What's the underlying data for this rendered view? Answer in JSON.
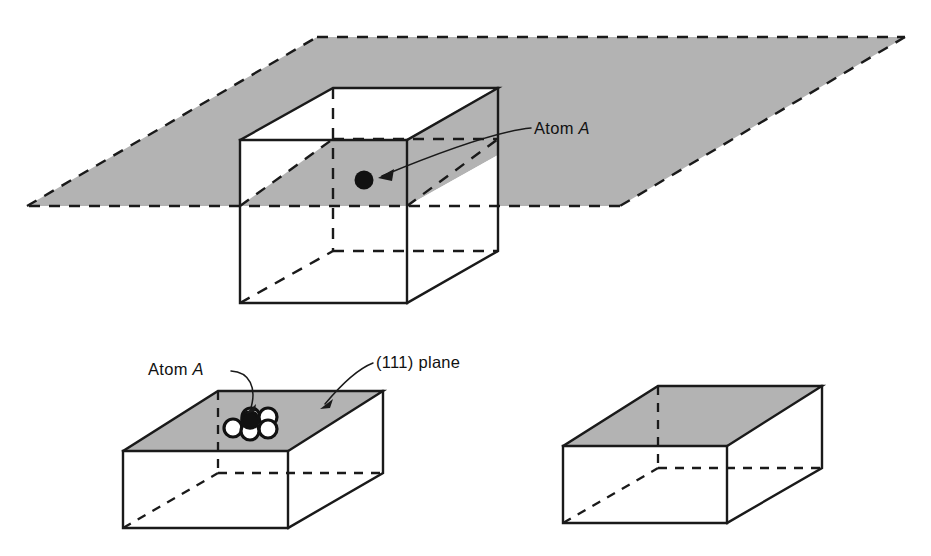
{
  "figure": {
    "background_color": "#ffffff",
    "plane_fill_color": "#b3b3b3",
    "line_color": "#1a1a1a",
    "atom_color": "#111111"
  },
  "labels": {
    "atom_a_top": "Atom A",
    "atom_a_top_prefix": "Atom ",
    "atom_a_top_italic": "A",
    "atom_a_bottom_prefix": "Atom ",
    "atom_a_bottom_italic": "A",
    "plane_111_label": "(111) plane"
  },
  "panels": [
    {
      "id": "top-panel",
      "name": "unit-cell-with-intersecting-plane",
      "description": "Cube intersected by a large shaded (111) plane, with atom A marked at the plane center",
      "shaded_plane": true,
      "atom_count": 1
    },
    {
      "id": "bottom-left-panel",
      "name": "unit-cell-with-atom-cluster",
      "description": "Rectangular box with shaded top (111) plane and close-packed atom cluster at atom A",
      "shaded_plane": true,
      "atom_count": 5
    },
    {
      "id": "bottom-right-panel",
      "name": "unit-cell-plain",
      "description": "Rectangular box with shaded top plane, no atoms",
      "shaded_plane": true,
      "atom_count": 0
    }
  ],
  "geometry": {
    "top_cube": {
      "front_top_left": [
        240,
        140
      ],
      "front_top_right": [
        407,
        140
      ],
      "front_bottom_left": [
        240,
        303
      ],
      "front_bottom_right": [
        407,
        303
      ],
      "back_top_left": [
        333,
        88
      ],
      "back_top_right": [
        498,
        88
      ],
      "back_bottom_left": [
        333,
        251
      ],
      "back_bottom_right": [
        498,
        251
      ]
    },
    "plane_parallelogram": [
      [
        27,
        206
      ],
      [
        317,
        37
      ],
      [
        905,
        37
      ],
      [
        620,
        206
      ]
    ],
    "atom_position": [
      364,
      180
    ],
    "bottom_left_box": {
      "front_top_left": [
        123,
        451
      ],
      "front_top_right": [
        288,
        451
      ],
      "front_bottom_left": [
        123,
        528
      ],
      "front_bottom_right": [
        288,
        528
      ],
      "back_top_left": [
        218,
        391
      ],
      "back_top_right": [
        383,
        391
      ],
      "back_bottom_right": [
        383,
        473
      ]
    },
    "bottom_right_box": {
      "front_top_left": [
        563,
        446
      ],
      "front_top_right": [
        727,
        446
      ],
      "front_bottom_left": [
        563,
        523
      ],
      "front_bottom_right": [
        727,
        523
      ],
      "back_top_left": [
        658,
        386
      ],
      "back_top_right": [
        822,
        386
      ],
      "back_bottom_right": [
        822,
        468
      ]
    }
  }
}
